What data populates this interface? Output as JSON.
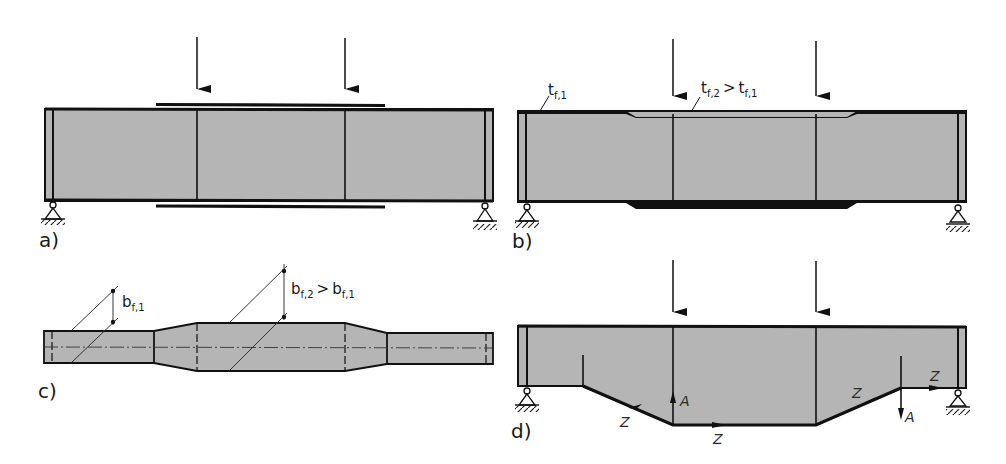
{
  "figure": {
    "colors": {
      "web_fill": "#b5b5b5",
      "line": "#111111",
      "background": "#ffffff"
    },
    "panels": [
      {
        "id": "a",
        "label": "a)",
        "content": "Beam with added cover plates on top and bottom flange between load points"
      },
      {
        "id": "b",
        "label": "b)",
        "content": "Beam with thickened flange between load points",
        "annotations": {
          "t1_main": "t",
          "t1_sub": "f,1",
          "t2_main": "t",
          "t2_sub": "f,2",
          "t2_compare": ">",
          "t2_ref_main": "t",
          "t2_ref_sub": "f,1"
        }
      },
      {
        "id": "c",
        "label": "c)",
        "content": "Plan view of flange with widened middle section",
        "annotations": {
          "b1_main": "b",
          "b1_sub": "f,1",
          "b2_main": "b",
          "b2_sub": "f,2",
          "b2_compare": ">",
          "b2_ref_main": "b",
          "b2_ref_sub": "f,1"
        }
      },
      {
        "id": "d",
        "label": "d)",
        "content": "Haunched beam with force flow",
        "forces": {
          "Z": "Z",
          "A": "A"
        }
      }
    ]
  }
}
